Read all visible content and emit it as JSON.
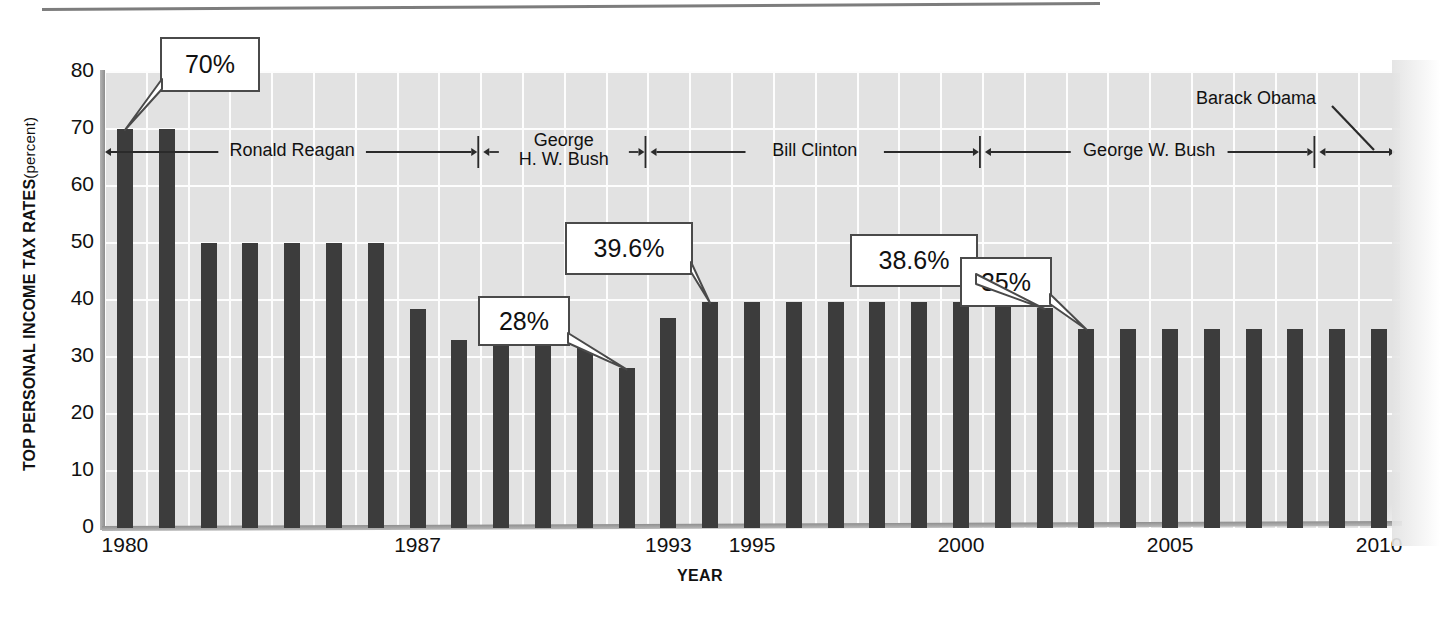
{
  "chart_data": {
    "type": "bar",
    "title": "",
    "xlabel": "YEAR",
    "ylabel": "TOP PERSONAL INCOME TAX RATES",
    "ylabel_unit": "(percent)",
    "ylim": [
      0,
      80
    ],
    "yticks": [
      "0",
      "10",
      "20",
      "30",
      "40",
      "50",
      "60",
      "70",
      "80"
    ],
    "ytick_values": [
      0,
      10,
      20,
      30,
      40,
      50,
      60,
      70,
      80
    ],
    "xticks": [
      "1980",
      "1987",
      "1993",
      "1995",
      "2000",
      "2005",
      "2010"
    ],
    "xtick_values": [
      1980,
      1987,
      1993,
      1995,
      2000,
      2005,
      2010
    ],
    "grid": true,
    "legend": "none",
    "bar_color": "#3c3c3c",
    "plot_background": "#e2e2e2",
    "gridline_color": "#fdfdfd",
    "categories": [
      1980,
      1981,
      1982,
      1983,
      1984,
      1985,
      1986,
      1987,
      1988,
      1989,
      1990,
      1991,
      1992,
      1993,
      1994,
      1995,
      1996,
      1997,
      1998,
      1999,
      2000,
      2001,
      2002,
      2003,
      2004,
      2005,
      2006,
      2007,
      2008,
      2009,
      2010
    ],
    "values": [
      70,
      70,
      50,
      50,
      50,
      50,
      50,
      38.5,
      33,
      33,
      33,
      31.5,
      28,
      36.9,
      39.6,
      39.6,
      39.6,
      39.6,
      39.6,
      39.6,
      39.6,
      39.1,
      38.6,
      35,
      35,
      35,
      35,
      35,
      35,
      35,
      35
    ]
  },
  "callouts": [
    {
      "id": "callout-70",
      "label": "70%",
      "value": 70.0,
      "year": 1980
    },
    {
      "id": "callout-28",
      "label": "28%",
      "value": 28.0,
      "year": 1992
    },
    {
      "id": "callout-396",
      "label": "39.6%",
      "value": 39.6,
      "year": 1994
    },
    {
      "id": "callout-386",
      "label": "38.6%",
      "value": 38.6,
      "year": 2002
    },
    {
      "id": "callout-35",
      "label": "35%",
      "value": 35.0,
      "year": 2003
    }
  ],
  "presidents": [
    {
      "id": "ronald-reagan",
      "name": "Ronald Reagan",
      "line1": "Ronald Reagan",
      "line2": "",
      "start_year": 1980,
      "end_year": 1988
    },
    {
      "id": "george-hw-bush",
      "name": "George H. W. Bush",
      "line1": "George",
      "line2": "H. W. Bush",
      "start_year": 1989,
      "end_year": 1992
    },
    {
      "id": "bill-clinton",
      "name": "Bill Clinton",
      "line1": "Bill Clinton",
      "line2": "",
      "start_year": 1993,
      "end_year": 2000
    },
    {
      "id": "george-w-bush",
      "name": "George W. Bush",
      "line1": "George W. Bush",
      "line2": "",
      "start_year": 2001,
      "end_year": 2008
    },
    {
      "id": "barack-obama",
      "name": "Barack Obama",
      "line1": "Barack Obama",
      "line2": "",
      "start_year": 2009,
      "end_year": 2010
    }
  ]
}
